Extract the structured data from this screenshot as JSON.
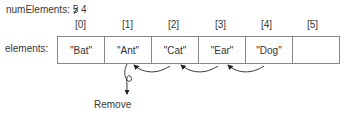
{
  "num_elements": {
    "label": "numElements:",
    "old_value": "5",
    "new_value": "4"
  },
  "array": {
    "label": "elements:",
    "indices": [
      "[0]",
      "[1]",
      "[2]",
      "[3]",
      "[4]",
      "[5]"
    ],
    "cells": [
      "\"Bat\"",
      "\"Ant\"",
      "\"Cat\"",
      "\"Ear\"",
      "\"Dog\"",
      ""
    ]
  },
  "annotation": {
    "remove_label": "Remove"
  },
  "colors": {
    "line": "#888888",
    "text": "#333333"
  }
}
